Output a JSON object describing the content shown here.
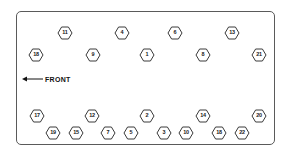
{
  "diagram": {
    "orientation_label": "FRONT",
    "arrow_icon": "arrow-left-icon",
    "colors": {
      "border": "#5a5a5a",
      "marker_outline": "#3a3a3a",
      "text": "#1a1a1a",
      "background": "#ffffff"
    },
    "enclosure": {
      "x": 16,
      "y": 11,
      "width": 259,
      "height": 134
    },
    "front_indicator": {
      "label": "FRONT",
      "x": 22,
      "y": 79,
      "direction": "left"
    },
    "rows": [
      {
        "name": "row-1",
        "y": 33,
        "markers": [
          {
            "label": "11",
            "x": 65
          },
          {
            "label": "4",
            "x": 122
          },
          {
            "label": "6",
            "x": 175
          },
          {
            "label": "13",
            "x": 232
          }
        ]
      },
      {
        "name": "row-2",
        "y": 55,
        "markers": [
          {
            "label": "18",
            "x": 36
          },
          {
            "label": "9",
            "x": 93
          },
          {
            "label": "1",
            "x": 147
          },
          {
            "label": "8",
            "x": 203
          },
          {
            "label": "21",
            "x": 259
          }
        ]
      },
      {
        "name": "row-3",
        "y": 116,
        "markers": [
          {
            "label": "17",
            "x": 37
          },
          {
            "label": "12",
            "x": 92
          },
          {
            "label": "2",
            "x": 147
          },
          {
            "label": "14",
            "x": 203
          },
          {
            "label": "20",
            "x": 259
          }
        ]
      },
      {
        "name": "row-4",
        "y": 133,
        "markers": [
          {
            "label": "19",
            "x": 53
          },
          {
            "label": "15",
            "x": 76
          },
          {
            "label": "7",
            "x": 108
          },
          {
            "label": "5",
            "x": 131
          },
          {
            "label": "3",
            "x": 164
          },
          {
            "label": "10",
            "x": 186
          },
          {
            "label": "18",
            "x": 219
          },
          {
            "label": "22",
            "x": 242
          }
        ]
      }
    ]
  }
}
